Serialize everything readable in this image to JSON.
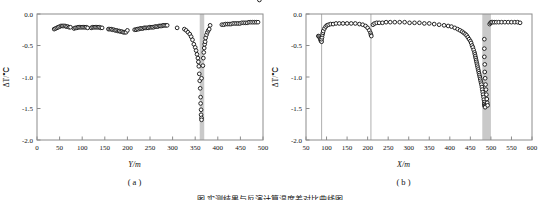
{
  "figure": {
    "caption": "图  实测结果与反演计算温度差对比曲线图",
    "panels": [
      {
        "key": "a",
        "sublabel": "( a )",
        "axis_title_var": "Y",
        "axis_title_unit": "/m"
      },
      {
        "key": "b",
        "sublabel": "( b )",
        "axis_title_var": "X",
        "axis_title_unit": "/m"
      }
    ]
  },
  "style": {
    "marker_edge": "#1a1a1a",
    "marker_fill": "#ffffff",
    "band_color": "#c9c9c9",
    "line_color": "#b0b0b0",
    "axis_color": "#8c8c8c",
    "text_color": "#111111"
  },
  "chart_data": [
    {
      "type": "scatter",
      "panel": "a",
      "title": "",
      "xlabel": "Y/m",
      "ylabel": "ΔT/℃",
      "xlim": [
        0,
        500
      ],
      "ylim": [
        -2.0,
        0.0
      ],
      "xticks": [
        0,
        50,
        100,
        150,
        200,
        250,
        300,
        350,
        400,
        450,
        500
      ],
      "yticks": [
        0.0,
        -0.5,
        -1.0,
        -1.5,
        -2.0
      ],
      "ytick_labels": [
        "0.0",
        "-0.5",
        "-1.0",
        "-1.5",
        "-2.0"
      ],
      "grid": false,
      "legend": "none",
      "marker": "open-circle",
      "annotations": [
        {
          "kind": "vertical-band",
          "x_start": 360,
          "x_end": 370,
          "color": "#c9c9c9"
        }
      ],
      "series": [
        {
          "name": "ΔT",
          "x": [
            38,
            41,
            44,
            47,
            50,
            53,
            56,
            59,
            62,
            65,
            68,
            71,
            74,
            82,
            85,
            88,
            91,
            94,
            97,
            100,
            103,
            106,
            109,
            112,
            120,
            123,
            126,
            129,
            132,
            135,
            138,
            141,
            144,
            158,
            161,
            164,
            167,
            170,
            173,
            176,
            179,
            182,
            185,
            188,
            191,
            194,
            197,
            200,
            216,
            219,
            222,
            225,
            228,
            231,
            234,
            237,
            240,
            243,
            246,
            249,
            252,
            255,
            258,
            261,
            264,
            267,
            270,
            273,
            276,
            279,
            282,
            285,
            288,
            310,
            326,
            330,
            334,
            338,
            341,
            344,
            347,
            350,
            352,
            354,
            356,
            357,
            358,
            359,
            360,
            361,
            362,
            362,
            363,
            363,
            364,
            364,
            364,
            367,
            368,
            369,
            370,
            371,
            372,
            373,
            375,
            377,
            379,
            381,
            383,
            409,
            413,
            417,
            421,
            425,
            429,
            433,
            437,
            441,
            445,
            449,
            453,
            457,
            461,
            465,
            469,
            473,
            477,
            481,
            485,
            489,
            492
          ],
          "y": [
            -0.24,
            -0.23,
            -0.22,
            -0.21,
            -0.2,
            -0.19,
            -0.19,
            -0.19,
            -0.19,
            -0.2,
            -0.2,
            -0.21,
            -0.21,
            -0.23,
            -0.22,
            -0.22,
            -0.21,
            -0.21,
            -0.21,
            -0.21,
            -0.21,
            -0.21,
            -0.21,
            -0.22,
            -0.22,
            -0.21,
            -0.21,
            -0.21,
            -0.21,
            -0.21,
            -0.21,
            -0.22,
            -0.22,
            -0.24,
            -0.24,
            -0.24,
            -0.25,
            -0.25,
            -0.26,
            -0.26,
            -0.27,
            -0.27,
            -0.28,
            -0.28,
            -0.29,
            -0.29,
            -0.29,
            -0.26,
            -0.25,
            -0.25,
            -0.24,
            -0.24,
            -0.23,
            -0.23,
            -0.23,
            -0.22,
            -0.22,
            -0.22,
            -0.22,
            -0.21,
            -0.21,
            -0.21,
            -0.21,
            -0.2,
            -0.2,
            -0.2,
            -0.19,
            -0.19,
            -0.19,
            -0.18,
            -0.18,
            -0.18,
            -0.18,
            -0.22,
            -0.24,
            -0.26,
            -0.29,
            -0.32,
            -0.36,
            -0.41,
            -0.48,
            -0.53,
            -0.58,
            -0.64,
            -0.7,
            -0.76,
            -0.83,
            -0.95,
            -1.06,
            -1.18,
            -1.32,
            -1.42,
            -1.52,
            -1.6,
            -1.65,
            -1.68,
            -1.02,
            -0.82,
            -0.7,
            -0.61,
            -0.54,
            -0.48,
            -0.44,
            -0.38,
            -0.33,
            -0.29,
            -0.26,
            -0.24,
            -0.18,
            -0.17,
            -0.17,
            -0.16,
            -0.16,
            -0.16,
            -0.16,
            -0.15,
            -0.15,
            -0.15,
            -0.15,
            -0.15,
            -0.14,
            -0.14,
            -0.14,
            -0.14,
            -0.13,
            -0.13,
            -0.13,
            -0.13,
            -0.13,
            -0.13
          ]
        }
      ]
    },
    {
      "type": "scatter",
      "panel": "b",
      "title": "",
      "xlabel": "X/m",
      "ylabel": "ΔT/℃",
      "xlim": [
        50,
        600
      ],
      "ylim": [
        -2.0,
        0.0
      ],
      "xticks": [
        50,
        100,
        150,
        200,
        250,
        300,
        350,
        400,
        450,
        500,
        550,
        600
      ],
      "yticks": [
        0.0,
        -0.5,
        -1.0,
        -1.5,
        -2.0
      ],
      "ytick_labels": [
        "0.0",
        "-0.5",
        "-1.0",
        "-1.5",
        "-2.0"
      ],
      "grid": false,
      "legend": "none",
      "marker": "open-circle",
      "annotations": [
        {
          "kind": "vertical-line",
          "x": 88,
          "color": "#b0b0b0"
        },
        {
          "kind": "vertical-line",
          "x": 208,
          "color": "#b0b0b0"
        },
        {
          "kind": "vertical-band",
          "x_start": 479,
          "x_end": 500,
          "color": "#c9c9c9"
        }
      ],
      "series": [
        {
          "name": "ΔT",
          "x": [
            80,
            82,
            84,
            85,
            86,
            87,
            88,
            88,
            89,
            90,
            91,
            92,
            95,
            98,
            101,
            105,
            110,
            116,
            123,
            131,
            140,
            150,
            160,
            170,
            180,
            188,
            195,
            200,
            204,
            207,
            208,
            209,
            213,
            217,
            222,
            228,
            236,
            245,
            255,
            266,
            278,
            290,
            302,
            314,
            326,
            338,
            350,
            362,
            374,
            386,
            396,
            404,
            412,
            419,
            425,
            430,
            434,
            438,
            441,
            444,
            447,
            450,
            452,
            454,
            456,
            458,
            460,
            461,
            462,
            463,
            464,
            465,
            466,
            467,
            468,
            469,
            470,
            471,
            472,
            473,
            474,
            475,
            476,
            477,
            478,
            479,
            480,
            481,
            482,
            483,
            484,
            484,
            485,
            485,
            486,
            486,
            484,
            484,
            484,
            485,
            485,
            486,
            487,
            488,
            489,
            490,
            491,
            492,
            497,
            499,
            501,
            504,
            508,
            513,
            519,
            526,
            534,
            542,
            550,
            558,
            565,
            571
          ],
          "y": [
            -0.35,
            -0.36,
            -0.38,
            -0.4,
            -0.42,
            -0.43,
            -0.44,
            -0.4,
            -0.37,
            -0.33,
            -0.3,
            -0.27,
            -0.23,
            -0.2,
            -0.18,
            -0.17,
            -0.16,
            -0.16,
            -0.15,
            -0.15,
            -0.15,
            -0.15,
            -0.15,
            -0.15,
            -0.16,
            -0.17,
            -0.19,
            -0.22,
            -0.26,
            -0.3,
            -0.33,
            -0.35,
            -0.17,
            -0.15,
            -0.14,
            -0.14,
            -0.14,
            -0.13,
            -0.13,
            -0.13,
            -0.13,
            -0.13,
            -0.14,
            -0.14,
            -0.14,
            -0.15,
            -0.15,
            -0.16,
            -0.17,
            -0.18,
            -0.19,
            -0.2,
            -0.22,
            -0.24,
            -0.26,
            -0.28,
            -0.3,
            -0.32,
            -0.34,
            -0.37,
            -0.4,
            -0.43,
            -0.46,
            -0.5,
            -0.53,
            -0.57,
            -0.61,
            -0.64,
            -0.67,
            -0.7,
            -0.73,
            -0.76,
            -0.79,
            -0.82,
            -0.85,
            -0.88,
            -0.91,
            -0.94,
            -0.97,
            -1.0,
            -1.03,
            -1.06,
            -1.09,
            -1.12,
            -1.16,
            -1.2,
            -1.24,
            -1.28,
            -1.32,
            -1.36,
            -1.4,
            -1.43,
            -1.45,
            -1.46,
            -1.47,
            -1.48,
            -0.4,
            -0.55,
            -0.68,
            -0.8,
            -0.92,
            -1.02,
            -1.12,
            -1.2,
            -1.28,
            -1.35,
            -1.41,
            -1.45,
            -0.16,
            -0.14,
            -0.13,
            -0.13,
            -0.13,
            -0.13,
            -0.13,
            -0.13,
            -0.13,
            -0.13,
            -0.13,
            -0.13,
            -0.13,
            -0.14
          ]
        }
      ]
    }
  ]
}
